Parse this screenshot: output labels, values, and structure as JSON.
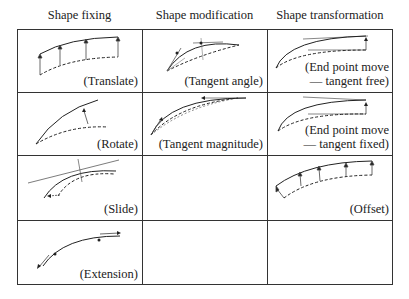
{
  "headers": [
    "Shape fixing",
    "Shape modification",
    "Shape transformation"
  ],
  "cells": {
    "translate": "(Translate)",
    "rotate": "(Rotate)",
    "slide": "(Slide)",
    "extension": "(Extension)",
    "tangent_angle": "(Tangent angle)",
    "tangent_magnitude": "(Tangent magnitude)",
    "end_free_l1": "(End point move",
    "end_free_l2": "— tangent free)",
    "end_fixed_l1": "(End point move",
    "end_fixed_l2": "— tangent fixed)",
    "offset": "(Offset)"
  },
  "grid": {
    "columns": 3,
    "rows": 4,
    "empty_cells": [
      "row3-col2",
      "row4-col2",
      "row4-col3"
    ]
  }
}
